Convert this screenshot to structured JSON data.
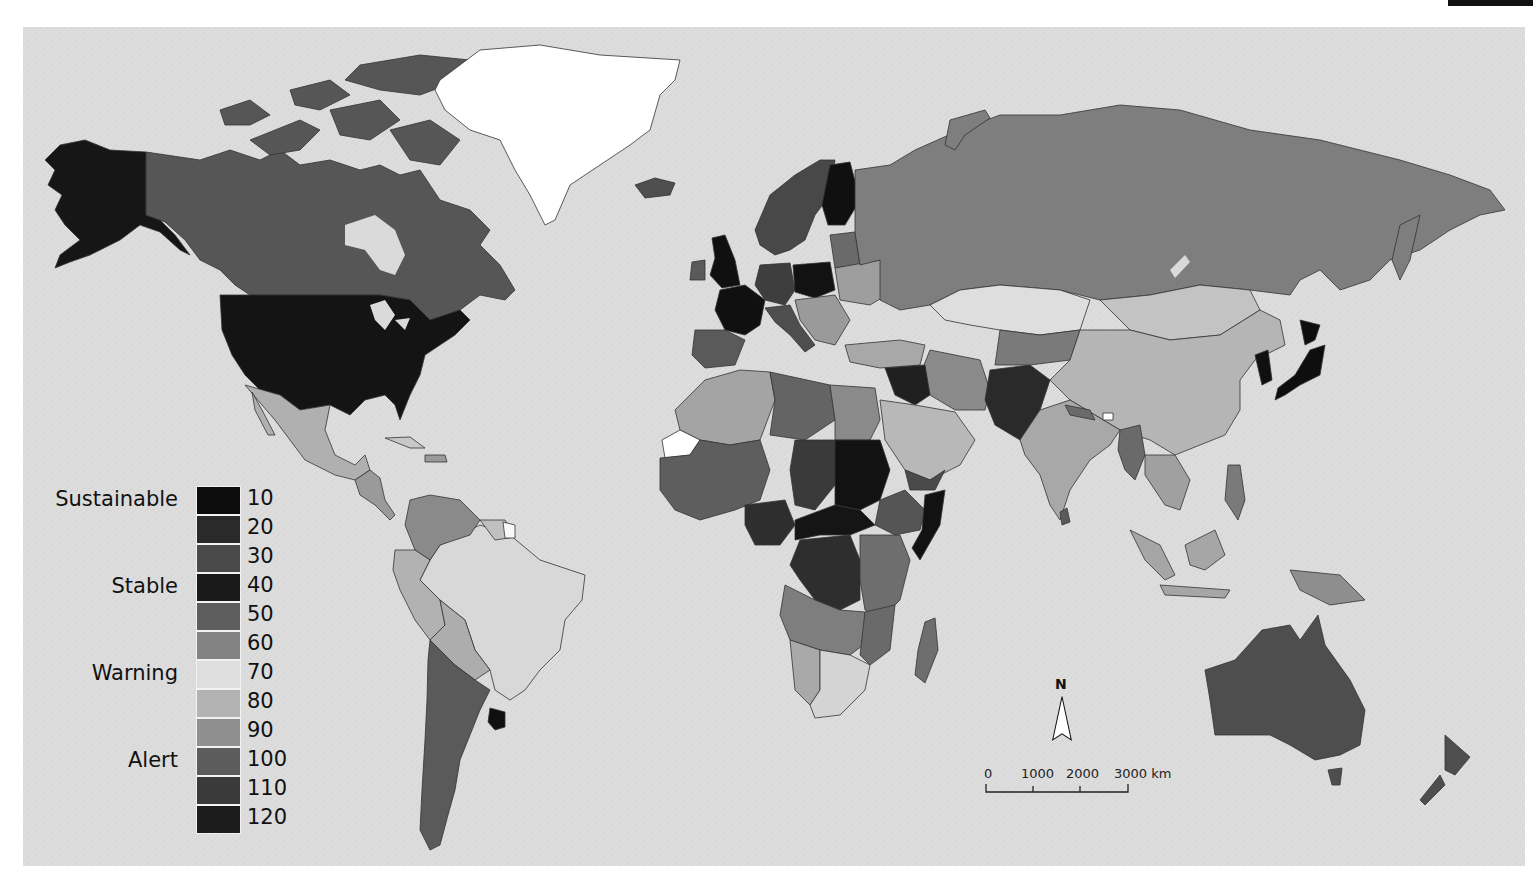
{
  "map": {
    "style": "grayscale choropleth world map",
    "background_color": "#dcdcdc",
    "ocean_color": "#dcdcdc"
  },
  "legend": {
    "categories": [
      {
        "label": "Sustainable",
        "row": 0
      },
      {
        "label": "Stable",
        "row": 3
      },
      {
        "label": "Warning",
        "row": 6
      },
      {
        "label": "Alert",
        "row": 9
      }
    ],
    "bins": [
      {
        "value": "10",
        "color": "#0c0c0c"
      },
      {
        "value": "20",
        "color": "#2a2a2a"
      },
      {
        "value": "30",
        "color": "#4a4a4a"
      },
      {
        "value": "40",
        "color": "#1a1a1a"
      },
      {
        "value": "50",
        "color": "#5e5e5e"
      },
      {
        "value": "60",
        "color": "#838383"
      },
      {
        "value": "70",
        "color": "#dedede"
      },
      {
        "value": "80",
        "color": "#b3b3b3"
      },
      {
        "value": "90",
        "color": "#8f8f8f"
      },
      {
        "value": "100",
        "color": "#5c5c5c"
      },
      {
        "value": "110",
        "color": "#3a3a3a"
      },
      {
        "value": "120",
        "color": "#1c1c1c"
      }
    ]
  },
  "north_arrow": {
    "label": "N"
  },
  "scale_bar": {
    "ticks": [
      "0",
      "1000",
      "2000",
      "3000 km"
    ],
    "unit": "km"
  },
  "regions": [
    {
      "name": "Alaska",
      "shade": "#161616"
    },
    {
      "name": "Canada",
      "shade": "#565656"
    },
    {
      "name": "United States",
      "shade": "#141414"
    },
    {
      "name": "Greenland",
      "shade": "#ffffff"
    },
    {
      "name": "Mexico",
      "shade": "#b0b0b0"
    },
    {
      "name": "Brazil",
      "shade": "#d8d8d8"
    },
    {
      "name": "Argentina",
      "shade": "#5a5a5a"
    },
    {
      "name": "Russia",
      "shade": "#7e7e7e"
    },
    {
      "name": "China",
      "shade": "#b5b5b5"
    },
    {
      "name": "India",
      "shade": "#a8a8a8"
    },
    {
      "name": "Australia",
      "shade": "#4e4e4e"
    },
    {
      "name": "Sudan",
      "shade": "#121212"
    },
    {
      "name": "Japan",
      "shade": "#0e0e0e"
    }
  ]
}
